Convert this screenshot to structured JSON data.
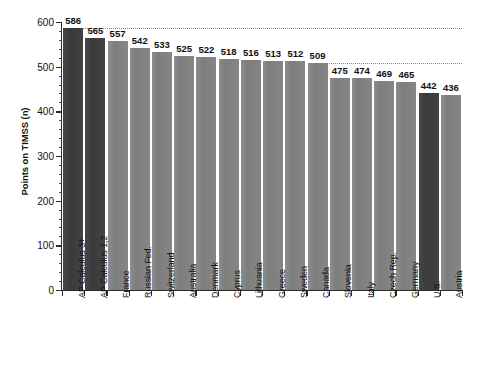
{
  "chart_data": {
    "type": "bar",
    "title": "",
    "subtitle": "",
    "xlabel": "",
    "ylabel": "Points on TIMSS (n)",
    "ylim": [
      0,
      600
    ],
    "y_ticks": [
      0,
      100,
      200,
      300,
      400,
      500,
      600
    ],
    "y_minor_tick_interval": 20,
    "grid": false,
    "legend": "none",
    "orientation": "vertical",
    "categories": [
      "AP Calculus 3+",
      "AP Calculus 1,2",
      "France",
      "Russian Fed.",
      "Switzerland",
      "Australia",
      "Denmark",
      "Cyprus",
      "Lithuania",
      "Greece",
      "Sweden",
      "Canada",
      "Slovenia",
      "Italy",
      "Czech Rep.",
      "Germany",
      "U.S.",
      "Austria"
    ],
    "values": [
      586,
      565,
      557,
      542,
      533,
      525,
      522,
      518,
      516,
      513,
      512,
      509,
      475,
      474,
      469,
      465,
      442,
      436
    ],
    "value_labels": [
      "586",
      "565",
      "557",
      "542",
      "533",
      "525",
      "522",
      "518",
      "516",
      "513",
      "512",
      "509",
      "475",
      "474",
      "469",
      "465",
      "442",
      "436"
    ],
    "highlighted_categories": [
      "AP Calculus 3+",
      "AP Calculus 1,2",
      "U.S."
    ],
    "reference_lines": [
      {
        "value": 586,
        "label": "586",
        "style": "dotted",
        "span": "full"
      },
      {
        "value": 509,
        "label": "509",
        "style": "dotted",
        "span": "right"
      }
    ],
    "colors": {
      "bar_default": "#828282",
      "bar_highlight": "#3f3f3f",
      "axis": "#2b2b2b",
      "reference_line": "#8c8c8c",
      "text": "#111111",
      "background": "#ffffff"
    }
  },
  "y_tick_labels": [
    "0",
    "100",
    "200",
    "300",
    "400",
    "500",
    "600"
  ]
}
